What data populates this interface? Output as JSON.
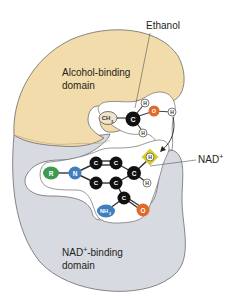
{
  "diagram": {
    "type": "enzyme-active-site",
    "labels": {
      "ethanol": "Ethanol",
      "alcohol_domain_line1": "Alcohol-binding",
      "alcohol_domain_line2": "domain",
      "nad": "NAD",
      "nad_sup": "+",
      "nad_domain_line1_a": "NAD",
      "nad_domain_line1_sup": "+",
      "nad_domain_line1_b": "-binding",
      "nad_domain_line2": "domain"
    },
    "ethanol_atoms": {
      "ch3": "CH",
      "ch3_sub": "3",
      "c": "C",
      "h_top": "H",
      "h_bottom": "H",
      "o": "O",
      "h_oh": "H"
    },
    "nad_atoms": {
      "r": "R",
      "n": "N",
      "c1": "C",
      "c2": "C",
      "c3": "C",
      "c4": "C",
      "c5": "C",
      "c_amide": "C",
      "h_transfer": "H",
      "h_ring": "H",
      "nh2": "NH",
      "nh2_sub": "2",
      "o": "O"
    },
    "colors": {
      "alcohol_domain": "#f3dcab",
      "nad_domain": "#d8dae2",
      "outline": "#6b6b6b",
      "carbon": "#111111",
      "oxygen": "#e06a2a",
      "nitrogen": "#3f7fc0",
      "r_group": "#3e9a4e",
      "hydrogen": "#ffffff",
      "ch3": "#efe3cc",
      "hydride_highlight": "#d8cd2a"
    }
  }
}
